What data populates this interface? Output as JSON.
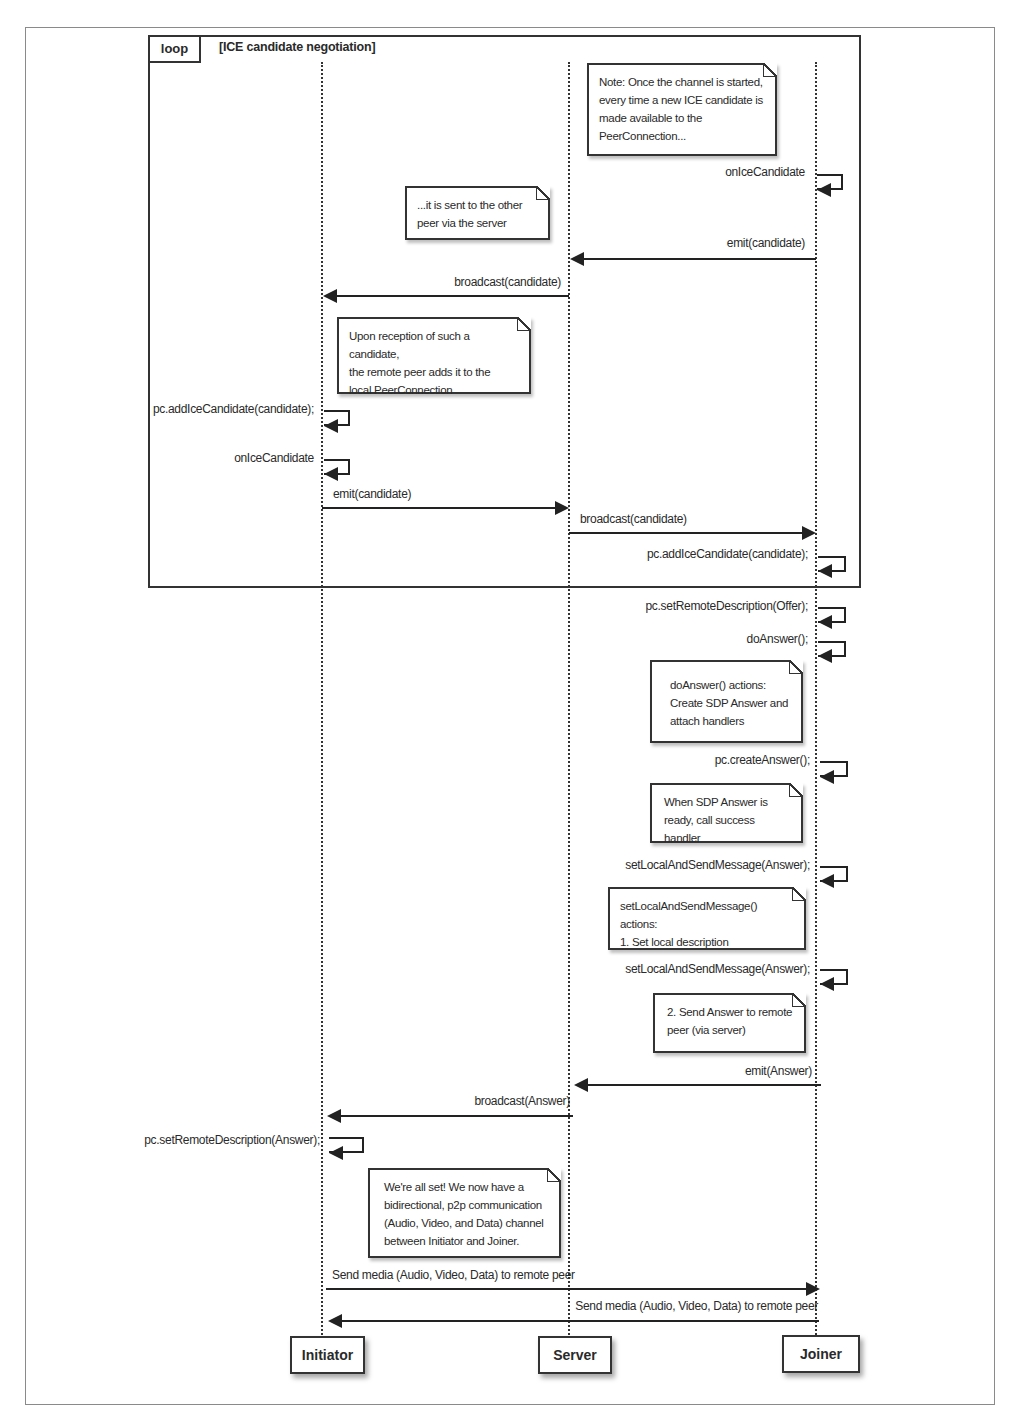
{
  "diagram": {
    "type": "UML sequence diagram",
    "loop": {
      "tag": "loop",
      "condition": "[ICE candidate negotiation]"
    },
    "actors": [
      {
        "id": "initiator",
        "label": "Initiator"
      },
      {
        "id": "server",
        "label": "Server"
      },
      {
        "id": "joiner",
        "label": "Joiner"
      }
    ],
    "notes": [
      {
        "id": "n1",
        "lines": [
          "Note: Once the channel is started,",
          "every time a new ICE candidate is",
          "made available to the",
          "PeerConnection..."
        ]
      },
      {
        "id": "n2",
        "lines": [
          "...it is sent to the other",
          "peer via the server"
        ]
      },
      {
        "id": "n3",
        "lines": [
          "Upon reception of such a candidate,",
          "the remote peer adds it to the",
          "local PeerConnection"
        ]
      },
      {
        "id": "n4",
        "lines": [
          "doAnswer() actions:",
          "Create SDP Answer and",
          "attach handlers"
        ]
      },
      {
        "id": "n5",
        "lines": [
          "When SDP Answer is",
          "ready, call success handler"
        ]
      },
      {
        "id": "n6",
        "lines": [
          "setLocalAndSendMessage() actions:",
          "1. Set local description"
        ]
      },
      {
        "id": "n7",
        "lines": [
          "2. Send Answer to remote",
          "peer (via server)"
        ]
      },
      {
        "id": "n8",
        "lines": [
          "We're all set! We now have a",
          "bidirectional, p2p communication",
          "(Audio, Video, and Data) channel",
          "between Initiator and Joiner."
        ]
      }
    ],
    "messages": [
      {
        "id": "m1",
        "from": "joiner",
        "to": "joiner",
        "label": "onIceCandidate"
      },
      {
        "id": "m2",
        "from": "joiner",
        "to": "server",
        "label": "emit(candidate)"
      },
      {
        "id": "m3",
        "from": "server",
        "to": "initiator",
        "label": "broadcast(candidate)"
      },
      {
        "id": "m4",
        "from": "initiator",
        "to": "initiator",
        "label": "pc.addIceCandidate(candidate);"
      },
      {
        "id": "m5",
        "from": "initiator",
        "to": "initiator",
        "label": "onIceCandidate"
      },
      {
        "id": "m6",
        "from": "initiator",
        "to": "server",
        "label": "emit(candidate)"
      },
      {
        "id": "m7",
        "from": "server",
        "to": "joiner",
        "label": "broadcast(candidate)"
      },
      {
        "id": "m8",
        "from": "joiner",
        "to": "joiner",
        "label": "pc.addIceCandidate(candidate);"
      },
      {
        "id": "m9",
        "from": "joiner",
        "to": "joiner",
        "label": "pc.setRemoteDescription(Offer);"
      },
      {
        "id": "m10",
        "from": "joiner",
        "to": "joiner",
        "label": "doAnswer();"
      },
      {
        "id": "m11",
        "from": "joiner",
        "to": "joiner",
        "label": "pc.createAnswer();"
      },
      {
        "id": "m12",
        "from": "joiner",
        "to": "joiner",
        "label": "setLocalAndSendMessage(Answer);"
      },
      {
        "id": "m13",
        "from": "joiner",
        "to": "joiner",
        "label": "setLocalAndSendMessage(Answer);"
      },
      {
        "id": "m14",
        "from": "joiner",
        "to": "server",
        "label": "emit(Answer)"
      },
      {
        "id": "m15",
        "from": "server",
        "to": "initiator",
        "label": "broadcast(Answer)"
      },
      {
        "id": "m16",
        "from": "initiator",
        "to": "initiator",
        "label": "pc.setRemoteDescription(Answer);"
      },
      {
        "id": "m17",
        "from": "initiator",
        "to": "joiner",
        "label": "Send media (Audio, Video, Data) to remote peer"
      },
      {
        "id": "m18",
        "from": "joiner",
        "to": "initiator",
        "label": "Send media (Audio, Video, Data) to remote peer"
      }
    ]
  }
}
